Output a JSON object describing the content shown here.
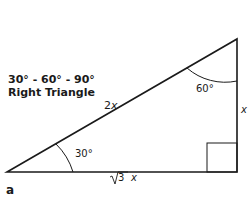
{
  "diagram": {
    "title_line1": "30° - 60° - 90°",
    "title_line2": "Right Triangle",
    "hypotenuse_label": "2x",
    "vertical_side_label": "x",
    "base_label_radical": "3",
    "base_label_var": "x",
    "angle_bottom_left": "30°",
    "angle_top": "60°",
    "figure_label": "a",
    "line_color": "#1a1a1a"
  }
}
